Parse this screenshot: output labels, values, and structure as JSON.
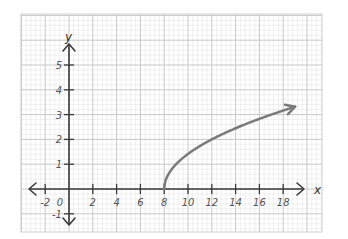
{
  "chart_data": {
    "type": "line",
    "title": "",
    "xlabel": "x",
    "ylabel": "y",
    "function": "y = sqrt(x - 8)",
    "xlim": [
      -3,
      21
    ],
    "ylim": [
      -1.7,
      7
    ],
    "grid": true,
    "x_ticks": [
      -2,
      0,
      2,
      4,
      6,
      8,
      10,
      12,
      14,
      16,
      18
    ],
    "x_tick_labels": [
      "-2",
      "0",
      "2",
      "4",
      "6",
      "8",
      "10",
      "12",
      "14",
      "16",
      "18"
    ],
    "y_ticks": [
      -1,
      1,
      2,
      3,
      4,
      5
    ],
    "y_tick_labels": [
      "-1",
      "1",
      "2",
      "3",
      "4",
      "5"
    ],
    "origin_label": "0",
    "series": [
      {
        "name": "sqrt(x-8)",
        "x": [
          8,
          8.25,
          8.5,
          9,
          10,
          11,
          12,
          13,
          14,
          15,
          16,
          17,
          18,
          19
        ],
        "y": [
          0,
          0.5,
          0.71,
          1,
          1.41,
          1.73,
          2,
          2.24,
          2.45,
          2.65,
          2.83,
          3,
          3.16,
          3.32
        ],
        "start_point": [
          8,
          0
        ],
        "end": "arrow",
        "color": "#7a7a7a"
      }
    ],
    "legend": null
  },
  "colors": {
    "background": "#ffffff",
    "grid_major": "#c8c8c8",
    "grid_minor": "#e6e6e6",
    "axis": "#3a3a3a",
    "curve": "#7a7a7a"
  }
}
